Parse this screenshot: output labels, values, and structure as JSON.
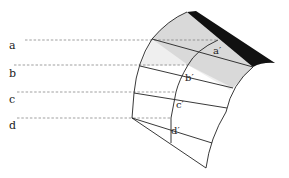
{
  "diagram": {
    "type": "curved-surface-projection",
    "left_labels": [
      "a",
      "b",
      "c",
      "d"
    ],
    "surface_labels": [
      "a′",
      "b′",
      "c′",
      "d′"
    ],
    "colors": {
      "edge_strip": "#111111",
      "top_shaded_region": "#d9d9d9",
      "second_row_region": "#efefef",
      "surface_fill": "#ffffff",
      "line": "#222222",
      "dashed_line": "#777777"
    }
  }
}
